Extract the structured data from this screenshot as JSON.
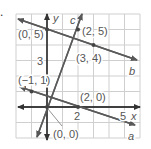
{
  "problem": {
    "number": "."
  },
  "axes": {
    "x_label": "x",
    "y_label": "y",
    "x_tick_labels": [
      "2",
      "5"
    ],
    "y_tick_labels": [
      "3"
    ]
  },
  "lines": [
    {
      "name": "a",
      "points": [
        [
          -1,
          1
        ],
        [
          2,
          0
        ]
      ]
    },
    {
      "name": "b",
      "points": [
        [
          0,
          5
        ],
        [
          3,
          4
        ]
      ]
    },
    {
      "name": "c",
      "points": [
        [
          0,
          0
        ],
        [
          2,
          5
        ]
      ]
    }
  ],
  "point_labels": {
    "p05": "(0, 5)",
    "p25": "(2, 5)",
    "p34": "(3, 4)",
    "pm11": "(−1, 1)",
    "p20": "(2, 0)",
    "p00": "(0, 0)"
  },
  "line_labels": {
    "a": "a",
    "b": "b",
    "c": "c"
  },
  "colors": {
    "grid": "#c8c8c8",
    "axis": "#333333",
    "line": "#5a5a5a",
    "text": "#555555"
  },
  "grid": {
    "x_min": -2,
    "x_max": 6,
    "y_min": -2,
    "y_max": 6
  }
}
